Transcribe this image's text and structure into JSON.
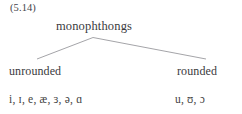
{
  "figure": {
    "example_number": "(5.14)",
    "root": {
      "label": "monophthongs"
    },
    "children": [
      {
        "label": "unrounded",
        "symbols": "i, ɪ, e, æ, ɜ, ə, ɑ"
      },
      {
        "label": "rounded",
        "symbols": "u, ʊ, ɔ"
      }
    ],
    "colors": {
      "background": "#ffffff",
      "text": "#3a3a3d",
      "line": "#9a9a9e"
    }
  }
}
